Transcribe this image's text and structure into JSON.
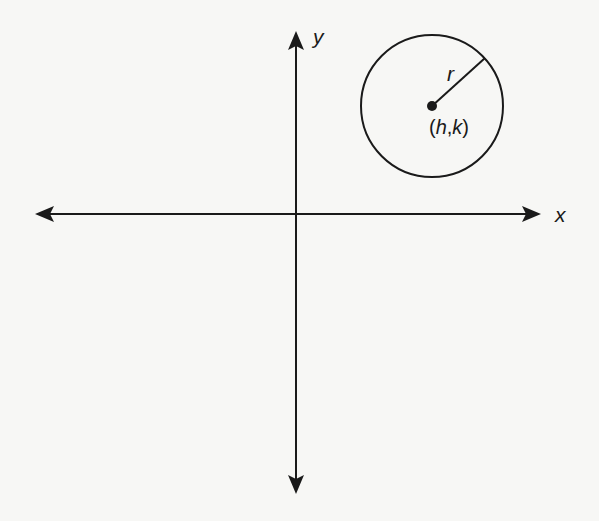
{
  "diagram": {
    "type": "coordinate-plane-circle",
    "axes": {
      "x_label": "x",
      "y_label": "y",
      "origin_px": [
        296,
        214
      ]
    },
    "circle": {
      "center_px": [
        432,
        106
      ],
      "radius_px": 71,
      "radius_label": "r",
      "center_label_open": "(",
      "center_label_h": "h",
      "center_label_comma": ",",
      "center_label_k": "k",
      "center_label_close": ")"
    },
    "colors": {
      "ink": "#1a1a1a",
      "paper": "#f7f7f5"
    }
  }
}
